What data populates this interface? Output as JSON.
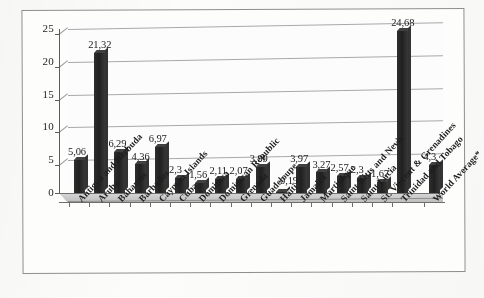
{
  "chart_data": {
    "type": "bar",
    "title": "",
    "subtitle": "",
    "xlabel": "",
    "ylabel": "",
    "ylim": [
      0,
      25
    ],
    "yticks": [
      0,
      5,
      10,
      15,
      20,
      25
    ],
    "ytick_labels": [
      "0",
      "5",
      "10",
      "15",
      "20",
      "25"
    ],
    "grid": true,
    "legend": false,
    "decimal_separator": ",",
    "categories": [
      "Antigua and Barbuda",
      "Aruba",
      "Bahamas",
      "Barbados",
      "Cayman Islands",
      "Cuba",
      "Dominica",
      "Dominican Republic",
      "Grenada",
      "Guadeloupe",
      "Haiti",
      "Jamaica",
      "Martinique",
      "Saint Kitts and Nevis",
      "Saint Lucia",
      "St. Vincent & Grenadines",
      "Trinidad and Tobago",
      "World Average*"
    ],
    "values": [
      5.06,
      21.32,
      6.29,
      4.36,
      6.97,
      2.3,
      1.56,
      2.11,
      2.07,
      3.99,
      0.19,
      3.97,
      3.27,
      2.57,
      2.3,
      1.67,
      24.68,
      4.3
    ],
    "data_labels": [
      "5,06",
      "21,32",
      "6,29",
      "4,36",
      "6,97",
      "2,3",
      "1,56",
      "2,11",
      "2,07",
      "3,99",
      "0,19",
      "3,97",
      "3,27",
      "2,57",
      "2,3",
      "1,67",
      "24,68",
      "4,3"
    ],
    "colors": {
      "bar": "#1f1f1f",
      "gridline": "#a8a8a8",
      "axis": "#5a5a5a",
      "plot_background": "#ffffff",
      "page_background": "#fcfcfb",
      "text": "#1a1a1a"
    }
  }
}
